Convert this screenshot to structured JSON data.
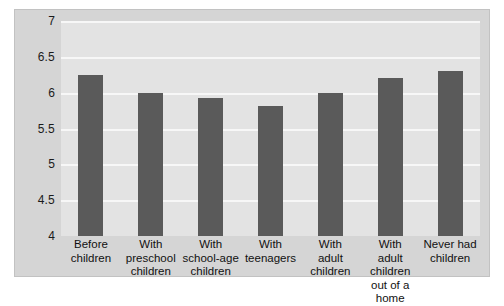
{
  "chart_data": {
    "type": "bar",
    "title": "",
    "xlabel": "",
    "ylabel": "",
    "ylim": [
      4,
      7
    ],
    "grid": true,
    "legend": "none",
    "yticks": [
      "7",
      "6.5",
      "6",
      "5.5",
      "5",
      "4.5",
      "4"
    ],
    "ytick_values": [
      7,
      6.5,
      6,
      5.5,
      5,
      4.5,
      4
    ],
    "categories": [
      "Before children",
      "With preschool children",
      "With school-age children",
      "With teenagers",
      "With adult children",
      "With adult children out of a home",
      "Never had children"
    ],
    "category_lines": [
      [
        "Before",
        "children"
      ],
      [
        "With",
        "preschool",
        "children"
      ],
      [
        "With",
        "school-age",
        "children"
      ],
      [
        "With",
        "teenagers"
      ],
      [
        "With",
        "adult",
        "children"
      ],
      [
        "With",
        "adult children",
        "out of a home"
      ],
      [
        "Never had",
        "children"
      ]
    ],
    "values": [
      6.25,
      6.0,
      5.93,
      5.82,
      6.0,
      6.2,
      6.3
    ]
  },
  "colors": {
    "bar": "#5a5a5a",
    "plot_background": "#e3e3e3",
    "figure_background": "#d5d5d5",
    "gridline": "#f7f7f7",
    "text": "#111111"
  }
}
